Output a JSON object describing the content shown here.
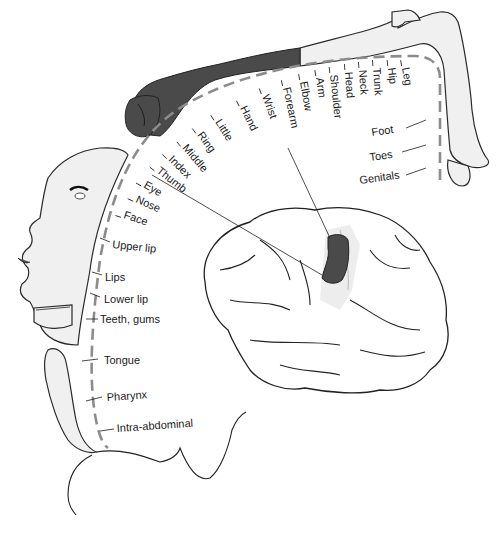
{
  "diagram": {
    "type": "sensory-homunculus",
    "labels_arc": [
      "Leg",
      "Hip",
      "Trunk",
      "Neck",
      "Head",
      "Shoulder",
      "Arm",
      "Elbow",
      "Forearm",
      "Wrist",
      "Hand",
      "Little",
      "Ring",
      "Middle",
      "Index",
      "Thumb",
      "Eye",
      "Nose",
      "Face"
    ],
    "labels_right": [
      "Foot",
      "Toes",
      "Genitals"
    ],
    "labels_left": [
      "Upper lip",
      "Lips",
      "Lower lip",
      "Teeth, gums",
      "Tongue",
      "Pharynx",
      "Intra-abdominal"
    ],
    "colors": {
      "highlight": "#4a4a4a",
      "body_fill": "#f0f0f0",
      "dashed_arc": "#8c8c8c",
      "line": "#222222"
    },
    "callouts": [
      "Forearm",
      "Thumb"
    ]
  }
}
